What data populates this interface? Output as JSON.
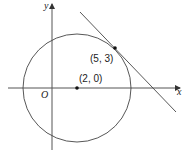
{
  "diagram": {
    "axes": {
      "x_label": "x",
      "y_label": "y",
      "origin_label": "O"
    },
    "circle": {
      "center_label": "(2, 0)",
      "center": [
        2,
        0
      ]
    },
    "tangent_point": {
      "label": "(5, 3)",
      "coords": [
        5,
        3
      ]
    },
    "tangent_line": {
      "description": "line tangent to circle at (5, 3)"
    },
    "colors": {
      "stroke": "#333333",
      "background": "#ffffff"
    }
  }
}
